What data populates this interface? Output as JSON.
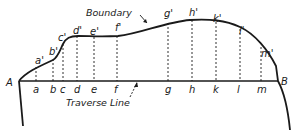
{
  "diagram": {
    "title_labels": {
      "boundary": "Boundary",
      "traverse_line": "Traverse Line"
    },
    "endpoints": {
      "start": "A",
      "end": "B"
    },
    "offsets": [
      {
        "base": "a",
        "top": "a'"
      },
      {
        "base": "b",
        "top": "b'"
      },
      {
        "base": "c",
        "top": "c'"
      },
      {
        "base": "d",
        "top": "d'"
      },
      {
        "base": "e",
        "top": "e'"
      },
      {
        "base": "f",
        "top": "f'"
      },
      {
        "base": "g",
        "top": "g'"
      },
      {
        "base": "h",
        "top": "h'"
      },
      {
        "base": "k",
        "top": "k'"
      },
      {
        "base": "l",
        "top": "l'"
      },
      {
        "base": "m",
        "top": "m'"
      }
    ],
    "colors": {
      "ink": "#1a1a1a",
      "background": "#ffffff"
    }
  }
}
